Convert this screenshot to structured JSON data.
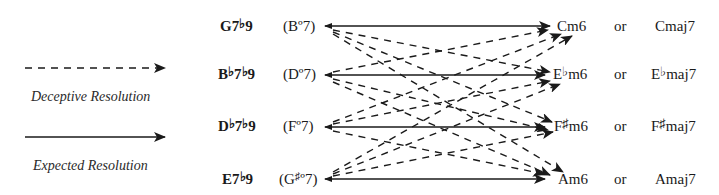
{
  "legend": {
    "deceptive_label": "Deceptive Resolution",
    "expected_label": "Expected Resolution"
  },
  "rows": [
    {
      "chord": {
        "root": "G",
        "acc": "",
        "rest": "7",
        "ext_acc": "♭",
        "ext": "9"
      },
      "dim": {
        "open": "(B",
        "acc": "",
        "deg": "º7)"
      },
      "target_m6": {
        "root": "C",
        "acc": "",
        "rest": "m6"
      },
      "or": "or",
      "target_maj7": {
        "root": "C",
        "acc": "",
        "rest": "maj7"
      }
    },
    {
      "chord": {
        "root": "B",
        "acc": "♭",
        "rest": "7",
        "ext_acc": "♭",
        "ext": "9"
      },
      "dim": {
        "open": "(D",
        "acc": "",
        "deg": "º7)"
      },
      "target_m6": {
        "root": "E",
        "acc": "♭",
        "rest": "m6"
      },
      "or": "or",
      "target_maj7": {
        "root": "E",
        "acc": "♭",
        "rest": "maj7"
      }
    },
    {
      "chord": {
        "root": "D",
        "acc": "♭",
        "rest": "7",
        "ext_acc": "♭",
        "ext": "9"
      },
      "dim": {
        "open": "(F",
        "acc": "",
        "deg": "º7)"
      },
      "target_m6": {
        "root": "F",
        "acc": "♯",
        "rest": "m6"
      },
      "or": "or",
      "target_maj7": {
        "root": "F",
        "acc": "♯",
        "rest": "maj7"
      }
    },
    {
      "chord": {
        "root": "E",
        "acc": "",
        "rest": "7",
        "ext_acc": "♭",
        "ext": "9"
      },
      "dim": {
        "open": "(G",
        "acc": "♯",
        "deg": "º7)"
      },
      "target_m6": {
        "root": "A",
        "acc": "",
        "rest": "m6"
      },
      "or": "or",
      "target_maj7": {
        "root": "A",
        "acc": "",
        "rest": "maj7"
      }
    }
  ],
  "colors": {
    "ink": "#1a1a1a",
    "background": "#ffffff"
  }
}
